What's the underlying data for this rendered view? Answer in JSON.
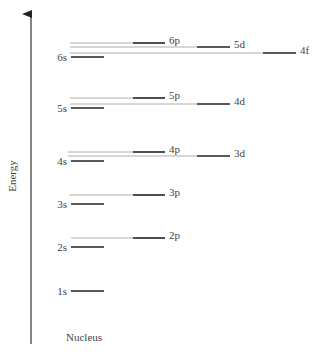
{
  "axis": {
    "label": "Energy",
    "origin_label": "Nucleus"
  },
  "colors": {
    "level": "#222222",
    "connector": "#9a9a9a",
    "text": "#444444"
  },
  "levels": [
    {
      "name": "1s",
      "y": 291,
      "x1": 71,
      "x2": 104,
      "label_side": "left"
    },
    {
      "name": "2s",
      "y": 247,
      "x1": 71,
      "x2": 104,
      "label_side": "left"
    },
    {
      "name": "2p",
      "y": 238,
      "x1": 133,
      "x2": 165,
      "label_side": "right",
      "connector_from": 71
    },
    {
      "name": "3s",
      "y": 204,
      "x1": 71,
      "x2": 104,
      "label_side": "left"
    },
    {
      "name": "3p",
      "y": 195,
      "x1": 133,
      "x2": 165,
      "label_side": "right",
      "connector_from": 69
    },
    {
      "name": "4s",
      "y": 161,
      "x1": 71,
      "x2": 104,
      "label_side": "left"
    },
    {
      "name": "3d",
      "y": 156,
      "x1": 197,
      "x2": 230,
      "label_side": "right",
      "connector_from": 68
    },
    {
      "name": "4p",
      "y": 152,
      "x1": 133,
      "x2": 165,
      "label_side": "right",
      "connector_from": 68
    },
    {
      "name": "5s",
      "y": 108,
      "x1": 71,
      "x2": 104,
      "label_side": "left"
    },
    {
      "name": "4d",
      "y": 104,
      "x1": 197,
      "x2": 230,
      "label_side": "right",
      "connector_from": 70
    },
    {
      "name": "5p",
      "y": 98,
      "x1": 133,
      "x2": 165,
      "label_side": "right",
      "connector_from": 70
    },
    {
      "name": "6s",
      "y": 57,
      "x1": 71,
      "x2": 104,
      "label_side": "left"
    },
    {
      "name": "4f",
      "y": 53,
      "x1": 263,
      "x2": 296,
      "label_side": "right",
      "connector_from": 70
    },
    {
      "name": "5d",
      "y": 47,
      "x1": 197,
      "x2": 230,
      "label_side": "right",
      "connector_from": 70
    },
    {
      "name": "6p",
      "y": 43,
      "x1": 133,
      "x2": 165,
      "label_side": "right",
      "connector_from": 70
    }
  ]
}
